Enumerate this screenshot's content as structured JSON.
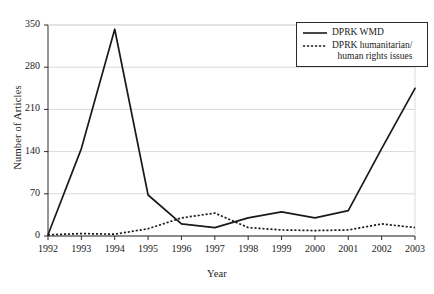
{
  "chart_data": {
    "type": "line",
    "title": "",
    "xlabel": "Year",
    "ylabel": "Number of Articles",
    "categories": [
      "1992",
      "1993",
      "1994",
      "1995",
      "1996",
      "1997",
      "1998",
      "1999",
      "2000",
      "2001",
      "2002",
      "2003"
    ],
    "x": [
      1992,
      1993,
      1994,
      1995,
      1996,
      1997,
      1998,
      1999,
      2000,
      2001,
      2002,
      2003
    ],
    "xlim": [
      1992,
      2003
    ],
    "ylim": [
      0,
      350
    ],
    "yticks": [
      0,
      70,
      140,
      210,
      280,
      350
    ],
    "grid": true,
    "legend_position": "top-right",
    "series": [
      {
        "name": "DPRK WMD",
        "style": "solid",
        "color": "#1a1a1a",
        "values": [
          2,
          145,
          343,
          68,
          20,
          14,
          30,
          40,
          30,
          42,
          145,
          245
        ]
      },
      {
        "name": "DPRK humanitarian/ human rights issues",
        "style": "dotted",
        "color": "#1a1a1a",
        "values": [
          2,
          4,
          3,
          12,
          30,
          38,
          14,
          10,
          9,
          10,
          20,
          14
        ]
      }
    ]
  },
  "axes": {
    "ylabel": "Number of Articles",
    "xlabel": "Year",
    "ytick_labels": [
      "0",
      "70",
      "140",
      "210",
      "280",
      "350"
    ],
    "xtick_labels": [
      "1992",
      "1993",
      "1994",
      "1995",
      "1996",
      "1997",
      "1998",
      "1999",
      "2000",
      "2001",
      "2002",
      "2003"
    ]
  },
  "legend": {
    "entries": [
      {
        "label": "DPRK WMD",
        "label_line2": "",
        "style": "solid"
      },
      {
        "label": "DPRK humanitarian/",
        "label_line2": "human rights issues",
        "style": "dotted"
      }
    ]
  },
  "colors": {
    "line": "#1a1a1a",
    "grid": "#d9d9d9",
    "axis": "#2b2b2b",
    "background": "#ffffff"
  }
}
